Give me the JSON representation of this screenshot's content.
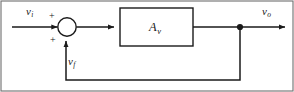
{
  "diagram": {
    "frame_color": "#6e6e6e",
    "line_color": "#1a1a1a",
    "background": "#ffffff",
    "input": {
      "symbol": "v",
      "subscript": "i",
      "name": "input-voltage"
    },
    "output": {
      "symbol": "v",
      "subscript": "o",
      "name": "output-voltage"
    },
    "feedback": {
      "symbol": "v",
      "subscript": "f",
      "name": "feedback-voltage"
    },
    "block": {
      "symbol": "A",
      "subscript": "v",
      "name": "voltage-gain-block"
    },
    "summing_junction": {
      "sign_input": "+",
      "sign_feedback": "+",
      "name": "summing-junction"
    }
  }
}
